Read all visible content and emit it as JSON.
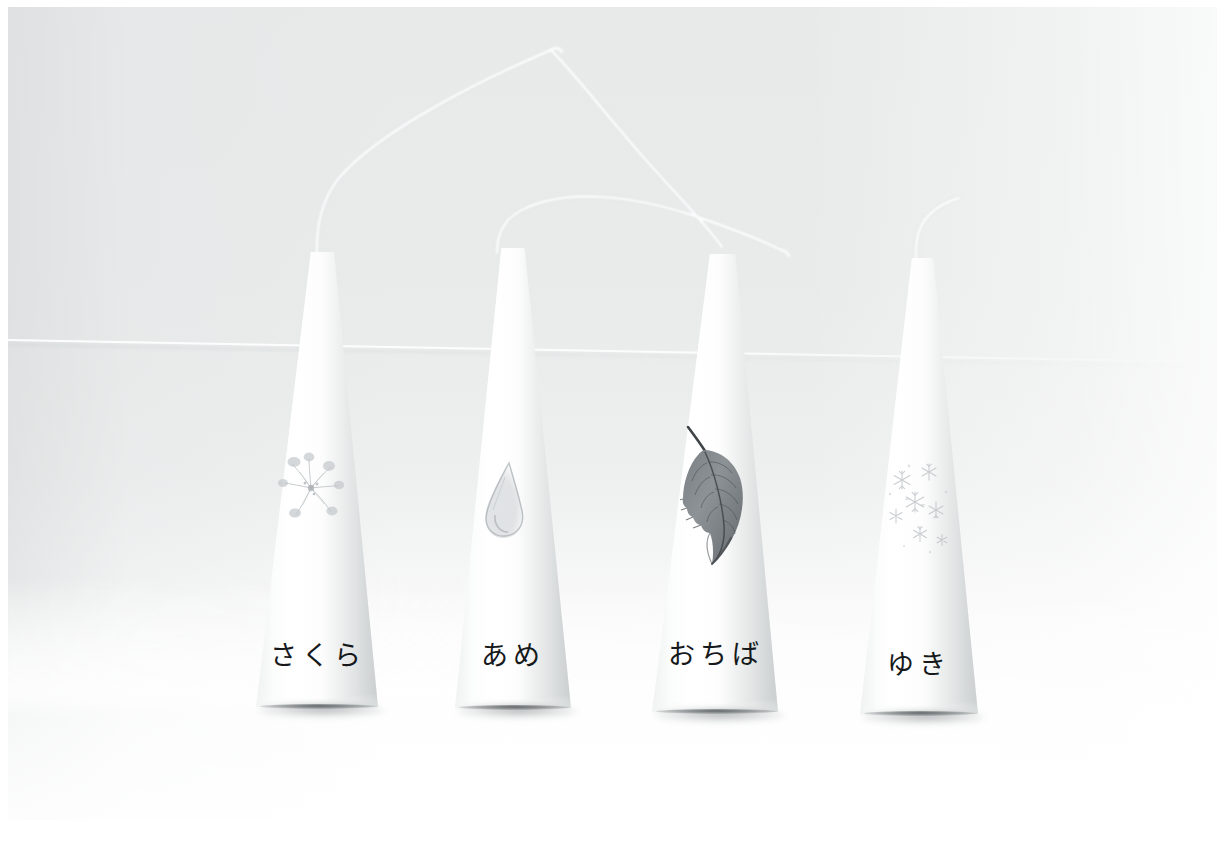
{
  "scene": {
    "title": "Four white paper cone ornaments on a pale backdrop",
    "object_count": 4,
    "background_color": "#ebecec",
    "foreground_color": "#fdfdfd",
    "label_color": "#15191b"
  },
  "cones": [
    {
      "id": "cone-sakura",
      "label": "さくら",
      "motif": "cherry-blossom",
      "motif_tone": "#b9bec2",
      "wire": "tall-arc-left",
      "order": 1
    },
    {
      "id": "cone-ame",
      "label": "あめ",
      "motif": "raindrop",
      "motif_tone": "#b0b6ba",
      "wire": "low-arc-right",
      "order": 2
    },
    {
      "id": "cone-ochiba",
      "label": "おちば",
      "motif": "fallen-leaf",
      "motif_tone": "#5d6366",
      "wire": "arc-terminus",
      "order": 3
    },
    {
      "id": "cone-yuki",
      "label": "ゆき",
      "motif": "snowflakes",
      "motif_tone": "#bcc1c5",
      "wire": "short-hook",
      "order": 4
    }
  ]
}
